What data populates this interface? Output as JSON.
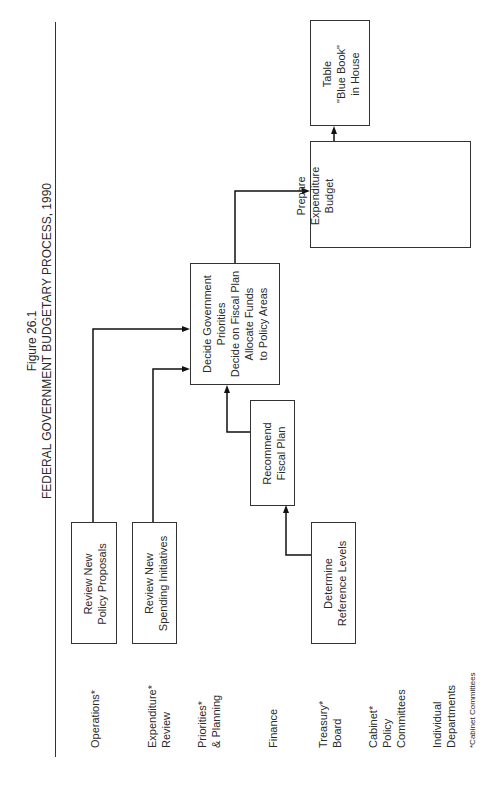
{
  "figure": {
    "number": "Figure 26.1",
    "title": "FEDERAL GOVERNMENT BUDGETARY PROCESS, 1990"
  },
  "rows": [
    {
      "label": [
        "Operations*"
      ]
    },
    {
      "label": [
        "Expenditure*",
        "Review"
      ]
    },
    {
      "label": [
        "Priorities*",
        "& Planning"
      ]
    },
    {
      "label": [
        "Finance"
      ]
    },
    {
      "label": [
        "Treasury*",
        "Board"
      ]
    },
    {
      "label": [
        "Cabinet*",
        "Policy",
        "Committees"
      ]
    },
    {
      "label": [
        "Individual",
        "Departments"
      ]
    }
  ],
  "row_labels": {
    "operations": "Operations*",
    "expenditure_1": "Expenditure*",
    "expenditure_2": "Review",
    "priorities_1": "Priorities*",
    "priorities_2": "& Planning",
    "finance": "Finance",
    "treasury_1": "Treasury*",
    "treasury_2": "Board",
    "cabinet_1": "Cabinet*",
    "cabinet_2": "Policy",
    "cabinet_3": "Committees",
    "individual_1": "Individual",
    "individual_2": "Departments"
  },
  "footnote": "*Cabinet Committees",
  "boxes": {
    "policy_proposals": {
      "line1": "Review New",
      "line2": "Policy Proposals"
    },
    "spending_initiatives": {
      "line1": "Review New",
      "line2": "Spending Initiatives"
    },
    "decide_priorities": {
      "line1": "Decide Government",
      "line2": "Priorities",
      "line3": "Decide on Fiscal Plan",
      "line4": "Allocate Funds",
      "line5": "to Policy Areas"
    },
    "recommend_fiscal": {
      "line1": "Recommend",
      "line2": "Fiscal Plan"
    },
    "reference_levels": {
      "line1": "Determine",
      "line2": "Reference Levels"
    },
    "prepare_budget": {
      "line1": "Prepare",
      "line2": "Expenditure",
      "line3": "Budget"
    },
    "blue_book": {
      "line1": "Table",
      "line2": "\"Blue Book\"",
      "line3": "in House"
    }
  },
  "connections": [
    {
      "from": "Review New Policy Proposals",
      "to": "Decide Government Priorities"
    },
    {
      "from": "Review New Spending Initiatives",
      "to": "Decide Government Priorities"
    },
    {
      "from": "Determine Reference Levels",
      "to": "Recommend Fiscal Plan"
    },
    {
      "from": "Recommend Fiscal Plan",
      "to": "Decide Government Priorities"
    },
    {
      "from": "Decide Government Priorities",
      "to": "Prepare Expenditure Budget"
    },
    {
      "from": "Prepare Expenditure Budget",
      "to": "Table \"Blue Book\" in House"
    }
  ]
}
